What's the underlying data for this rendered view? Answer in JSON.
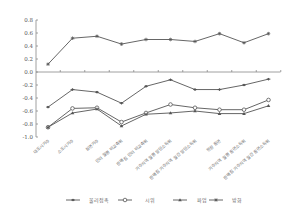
{
  "chart_data": {
    "type": "line",
    "title": "",
    "xlabel": "",
    "ylabel": "",
    "ylim": [
      -1.0,
      0.8
    ],
    "yticks": [
      "0.8",
      "0.6",
      "0.4",
      "0.2",
      "0.0",
      "-0.2",
      "-0.4",
      "-0.6",
      "-0.8",
      "-1.0"
    ],
    "grid": false,
    "legend_position": "bottom",
    "categories": [
      "대도시거주",
      "소도시거주",
      "읍면거주",
      "인터 월평 비교축위",
      "판매점 인터 비교축위",
      "거주지역 월평 말단소득위",
      "판매점 거주지역 월간 말단소득위",
      "현장 흡연",
      "거주지역 월평 흡연소득위",
      "판매점 거주지역 월간 흡연소득위"
    ],
    "series": [
      {
        "name": "물리접촉",
        "marker": "diamond",
        "values": [
          -0.54,
          -0.27,
          -0.31,
          -0.48,
          -0.22,
          -0.12,
          -0.27,
          -0.27,
          -0.2,
          -0.11
        ]
      },
      {
        "name": "시위",
        "marker": "circle",
        "values": [
          -0.85,
          -0.56,
          -0.55,
          -0.77,
          -0.63,
          -0.5,
          -0.55,
          -0.58,
          -0.58,
          -0.43
        ]
      },
      {
        "name": "파업",
        "marker": "triangle",
        "values": [
          -0.85,
          -0.63,
          -0.57,
          -0.83,
          -0.65,
          -0.63,
          -0.6,
          -0.64,
          -0.64,
          -0.52
        ]
      },
      {
        "name": "방화",
        "marker": "star",
        "values": [
          0.12,
          0.52,
          0.55,
          0.43,
          0.5,
          0.5,
          0.47,
          0.59,
          0.45,
          0.59
        ]
      }
    ]
  },
  "colors": {
    "line": "#555555",
    "axis": "#888888",
    "text": "#555555"
  }
}
